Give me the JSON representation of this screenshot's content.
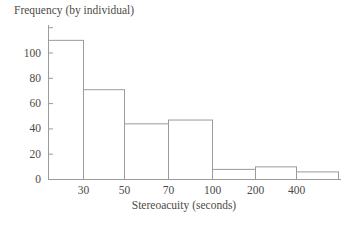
{
  "chart_data": {
    "type": "bar",
    "subtype": "histogram",
    "title": "Frequency (by individual)",
    "xlabel": "Stereoacuity (seconds)",
    "ylabel": "Frequency (by individual)",
    "categories": [
      "<30",
      "30-50",
      "50-70",
      "70-100",
      "100-200",
      "200-400",
      ">400"
    ],
    "values": [
      110,
      71,
      44,
      47,
      8,
      10,
      6
    ],
    "x_boundary_labels": [
      "30",
      "50",
      "70",
      "100",
      "200",
      "400"
    ],
    "y_ticks": [
      0,
      20,
      40,
      60,
      80,
      100
    ],
    "extra_unlabeled_y_tick": 120,
    "ylim": [
      0,
      120
    ],
    "grid": false,
    "legend": "none",
    "colors": {
      "line": "#9b9b9b",
      "text": "#4e4a44",
      "bar_fill": "#ffffff"
    }
  }
}
